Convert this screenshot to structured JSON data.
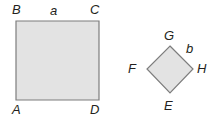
{
  "figure": {
    "background_color": "#ffffff",
    "width": 219,
    "height": 125
  },
  "style": {
    "fill_color": "#e3e3e3",
    "stroke_color": "#7d7d7d",
    "stroke_width": 1.2,
    "label_color": "#231f20"
  },
  "shapes": [
    {
      "name": "square",
      "kind": "square",
      "vertices": [
        {
          "label": "B",
          "x": 16,
          "y": 21
        },
        {
          "label": "C",
          "x": 99,
          "y": 21
        },
        {
          "label": "D",
          "x": 99,
          "y": 100
        },
        {
          "label": "A",
          "x": 16,
          "y": 100
        }
      ],
      "side_label": "a",
      "side_labeled": "BC"
    },
    {
      "name": "diamond",
      "kind": "square-rotated",
      "vertices": [
        {
          "label": "G",
          "x": 170,
          "y": 46
        },
        {
          "label": "H",
          "x": 193,
          "y": 69
        },
        {
          "label": "E",
          "x": 170,
          "y": 93
        },
        {
          "label": "F",
          "x": 147,
          "y": 69
        }
      ],
      "side_label": "b",
      "side_labeled": "GH"
    }
  ],
  "labels": {
    "B": "B",
    "a": "a",
    "C": "C",
    "A": "A",
    "D": "D",
    "G": "G",
    "b": "b",
    "F": "F",
    "H": "H",
    "E": "E"
  }
}
